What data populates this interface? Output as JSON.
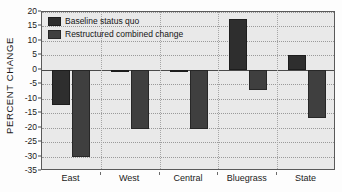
{
  "chart_data": {
    "type": "bar",
    "title": "",
    "subtitle": "",
    "xlabel": "",
    "ylabel": "PERCENT CHANGE",
    "categories": [
      "East",
      "West",
      "Central",
      "Bluegrass",
      "State"
    ],
    "series": [
      {
        "name": "Baseline status quo",
        "color": "#2e2e2e",
        "values": [
          -12,
          -0.5,
          -0.5,
          17.5,
          5
        ]
      },
      {
        "name": "Restructured combined change",
        "color": "#3f3f3f",
        "values": [
          -30,
          -20.5,
          -20.5,
          -7,
          -16.5
        ]
      }
    ],
    "ylim": [
      -35,
      20
    ],
    "ytick_step": 5,
    "yticks": [
      20,
      15,
      10,
      5,
      0,
      -5,
      -10,
      -15,
      -20,
      -25,
      -30,
      -35
    ],
    "ytick_labels": [
      "20",
      "15",
      "10",
      "5",
      "0",
      "-5",
      "-10",
      "-15",
      "-20",
      "-25",
      "-30",
      "-35"
    ],
    "grid": true,
    "grid_style": "dotted",
    "zero_line": true,
    "legend_position": "top-left-inside",
    "plot_background": "#e9e9e9",
    "figure_background": "#fdfdfd",
    "axis_color": "#5a5a5a"
  },
  "legend": {
    "items": [
      {
        "label": "Baseline status quo",
        "swatch": "baseline-swatch"
      },
      {
        "label": "Restructured combined change",
        "swatch": "restructured-swatch"
      }
    ]
  }
}
